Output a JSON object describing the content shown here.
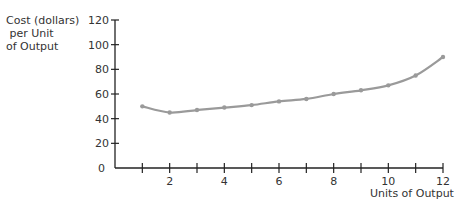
{
  "chart_data": {
    "type": "line",
    "title": "",
    "ylabel_lines": [
      "Cost (dollars)",
      " per Unit",
      "of Output"
    ],
    "xlabel": "Units of Output",
    "x": [
      1,
      2,
      3,
      4,
      5,
      6,
      7,
      8,
      9,
      10,
      11,
      12
    ],
    "series": [
      {
        "name": "Average cost",
        "values": [
          50,
          45,
          47,
          49,
          51,
          54,
          56,
          60,
          63,
          67,
          75,
          90
        ],
        "color": "#9a9a9a"
      }
    ],
    "xlim": [
      0,
      12
    ],
    "ylim": [
      0,
      120
    ],
    "xticks": [
      1,
      2,
      3,
      4,
      5,
      6,
      7,
      8,
      9,
      10,
      11,
      12
    ],
    "xtick_labels": [
      "",
      "2",
      "",
      "4",
      "",
      "6",
      "",
      "8",
      "",
      "10",
      "",
      "12"
    ],
    "yticks": [
      0,
      20,
      40,
      60,
      80,
      100,
      120
    ],
    "ytick_labels": [
      "0",
      "20",
      "40",
      "60",
      "80",
      "100",
      "120"
    ],
    "grid": false,
    "legend": "none"
  }
}
